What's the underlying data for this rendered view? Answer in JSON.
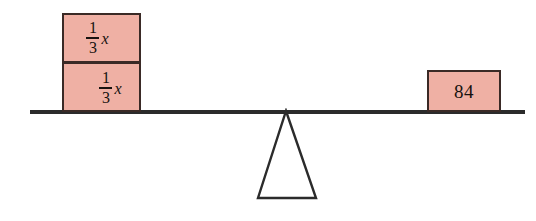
{
  "diagram": {
    "type": "balance-scale",
    "background_color": "#ffffff",
    "beam": {
      "label": "balance-beam",
      "color": "#2b2b2b"
    },
    "fulcrum": {
      "label": "fulcrum-triangle",
      "stroke_color": "#2b2b2b",
      "fill_color": "#ffffff"
    },
    "box_style": {
      "fill_color": "#efb0a4",
      "border_color": "#3a2a26",
      "text_color": "#17120f"
    },
    "left_side": {
      "boxes": [
        {
          "name": "box-one-third-x-top",
          "kind": "fraction-term",
          "numerator": "1",
          "denominator": "3",
          "variable": "x",
          "text": "1/3 x"
        },
        {
          "name": "box-one-third-x-bottom",
          "kind": "fraction-term",
          "numerator": "1",
          "denominator": "3",
          "variable": "x",
          "text": "1/3 x"
        }
      ]
    },
    "right_side": {
      "boxes": [
        {
          "name": "box-eighty-four",
          "kind": "number",
          "value": "84",
          "text": "84"
        }
      ]
    }
  }
}
